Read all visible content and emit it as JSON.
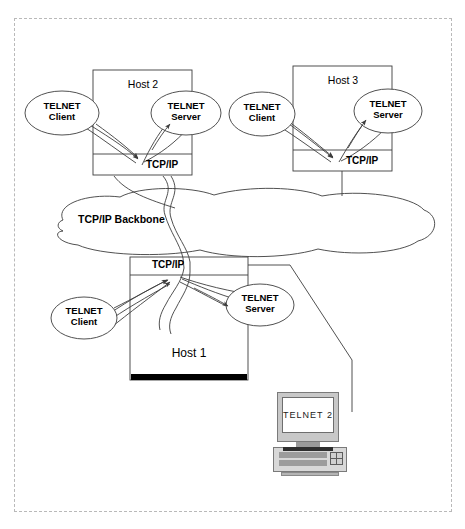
{
  "figure": {
    "border_color": "#b9b9b9"
  },
  "backbone": {
    "label": "TCP/IP Backbone"
  },
  "hosts": [
    {
      "id": "host-2",
      "title": "Host 2",
      "stack_label": "TCP/IP",
      "client_label_line1": "TELNET",
      "client_label_line2": "Client",
      "server_label_line1": "TELNET",
      "server_label_line2": "Server"
    },
    {
      "id": "host-3",
      "title": "Host 3",
      "stack_label": "TCP/IP",
      "client_label_line1": "TELNET",
      "client_label_line2": "Client",
      "server_label_line1": "TELNET",
      "server_label_line2": "Server"
    },
    {
      "id": "host-1",
      "title": "Host 1",
      "stack_label": "TCP/IP",
      "client_label_line1": "TELNET",
      "client_label_line2": "Client",
      "server_label_line1": "TELNET",
      "server_label_line2": "Server"
    }
  ],
  "terminal": {
    "screen_label": "TELNET 2",
    "bezel_color": "#c8c8c8",
    "screen_color": "#ffffff",
    "keyboard_color": "#d8d8d8"
  },
  "colors": {
    "line": "#3d3d3d",
    "black_bar": "#000000",
    "text": "#000000"
  }
}
